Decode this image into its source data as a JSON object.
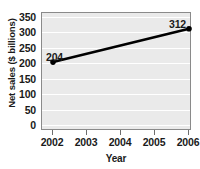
{
  "chart_data": {
    "type": "line",
    "title": "",
    "xlabel": "Year",
    "ylabel": "Net sales ($ billions)",
    "x": [
      2002,
      2003,
      2004,
      2005,
      2006
    ],
    "xtick_labels": [
      "2002",
      "2003",
      "2004",
      "2005",
      "2006"
    ],
    "xlim": [
      2002,
      2006
    ],
    "ylim": [
      0,
      350
    ],
    "ytick_labels": [
      "350",
      "300",
      "250",
      "200",
      "150",
      "100",
      "50",
      "0"
    ],
    "yticks": [
      350,
      300,
      250,
      200,
      150,
      100,
      50,
      0
    ],
    "grid": true,
    "legend": "none",
    "series": [
      {
        "name": "Net sales",
        "points": [
          {
            "x": 2002,
            "y": 204,
            "label": "204"
          },
          {
            "x": 2006,
            "y": 312,
            "label": "312"
          }
        ],
        "color": "#000000",
        "marker": "circle"
      }
    ],
    "annotations": [
      {
        "text": "204",
        "x": 2002,
        "y": 204,
        "position": "above-right"
      },
      {
        "text": "312",
        "x": 2006,
        "y": 312,
        "position": "above-left"
      }
    ],
    "plot_background": "#eaeaea",
    "gridline_color": "#ffffff",
    "axis_color": "#8a8a8a"
  }
}
